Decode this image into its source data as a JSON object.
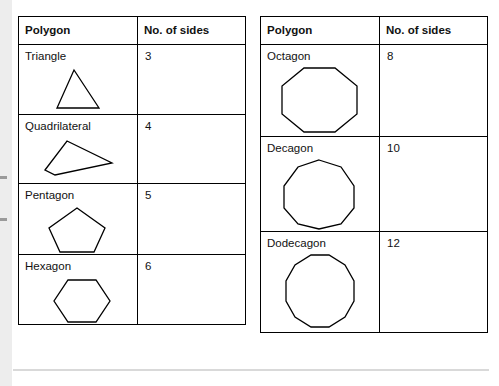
{
  "document": {
    "title": "Polygons and number of sides reference tables"
  },
  "tables": [
    {
      "id": "left",
      "headers": [
        "Polygon",
        "No. of sides"
      ],
      "rows": [
        {
          "name": "Triangle",
          "sides": "3",
          "shape": "triangle",
          "shape_sides": 3
        },
        {
          "name": "Quadrilateral",
          "sides": "4",
          "shape": "quadrilateral",
          "shape_sides": 4
        },
        {
          "name": "Pentagon",
          "sides": "5",
          "shape": "pentagon",
          "shape_sides": 5
        },
        {
          "name": "Hexagon",
          "sides": "6",
          "shape": "hexagon",
          "shape_sides": 6
        }
      ]
    },
    {
      "id": "right",
      "headers": [
        "Polygon",
        "No. of sides"
      ],
      "rows": [
        {
          "name": "Octagon",
          "sides": "8",
          "shape": "octagon",
          "shape_sides": 8
        },
        {
          "name": "Decagon",
          "sides": "10",
          "shape": "decagon",
          "shape_sides": 10
        },
        {
          "name": "Dodecagon",
          "sides": "12",
          "shape": "dodecagon",
          "shape_sides": 12
        }
      ]
    }
  ],
  "colors": {
    "page_background": "#ffffff",
    "table_border": "#000000",
    "text": "#111111",
    "left_band": "#ededed",
    "bottom_rule": "#d9d9d9"
  }
}
